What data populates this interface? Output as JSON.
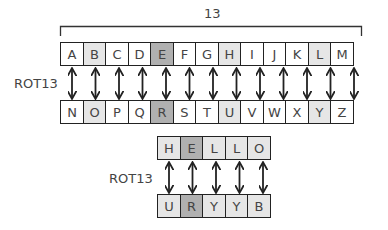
{
  "diagram": {
    "bracket_label": "13",
    "top_row": [
      {
        "letter": "A",
        "shade": "white"
      },
      {
        "letter": "B",
        "shade": "light"
      },
      {
        "letter": "C",
        "shade": "white"
      },
      {
        "letter": "D",
        "shade": "white"
      },
      {
        "letter": "E",
        "shade": "dark"
      },
      {
        "letter": "F",
        "shade": "white"
      },
      {
        "letter": "G",
        "shade": "white"
      },
      {
        "letter": "H",
        "shade": "light"
      },
      {
        "letter": "I",
        "shade": "white"
      },
      {
        "letter": "J",
        "shade": "white"
      },
      {
        "letter": "K",
        "shade": "white"
      },
      {
        "letter": "L",
        "shade": "light"
      },
      {
        "letter": "M",
        "shade": "white"
      }
    ],
    "bottom_row": [
      {
        "letter": "N",
        "shade": "white"
      },
      {
        "letter": "O",
        "shade": "light"
      },
      {
        "letter": "P",
        "shade": "white"
      },
      {
        "letter": "Q",
        "shade": "white"
      },
      {
        "letter": "R",
        "shade": "dark"
      },
      {
        "letter": "S",
        "shade": "white"
      },
      {
        "letter": "T",
        "shade": "white"
      },
      {
        "letter": "U",
        "shade": "light"
      },
      {
        "letter": "V",
        "shade": "white"
      },
      {
        "letter": "W",
        "shade": "white"
      },
      {
        "letter": "X",
        "shade": "white"
      },
      {
        "letter": "Y",
        "shade": "light"
      },
      {
        "letter": "Z",
        "shade": "white"
      }
    ],
    "alphabet_label": "ROT13",
    "example_label": "ROT13",
    "plain_word": [
      {
        "letter": "H",
        "shade": "light"
      },
      {
        "letter": "E",
        "shade": "dark"
      },
      {
        "letter": "L",
        "shade": "light"
      },
      {
        "letter": "L",
        "shade": "light"
      },
      {
        "letter": "O",
        "shade": "light"
      }
    ],
    "cipher_word": [
      {
        "letter": "U",
        "shade": "light"
      },
      {
        "letter": "R",
        "shade": "dark"
      },
      {
        "letter": "Y",
        "shade": "light"
      },
      {
        "letter": "Y",
        "shade": "light"
      },
      {
        "letter": "B",
        "shade": "light"
      }
    ]
  }
}
